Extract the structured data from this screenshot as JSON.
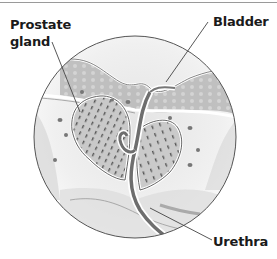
{
  "figure": {
    "type": "anatomical-illustration",
    "labels": {
      "prostate": "Prostate gland",
      "bladder": "Bladder",
      "urethra": "Urethra"
    },
    "colors": {
      "label_text": "#1a1a1a",
      "leader_line": "#444444",
      "circle_outline": "#555555",
      "tissue_gray": "#8a8a8a",
      "background": "#ffffff"
    }
  }
}
